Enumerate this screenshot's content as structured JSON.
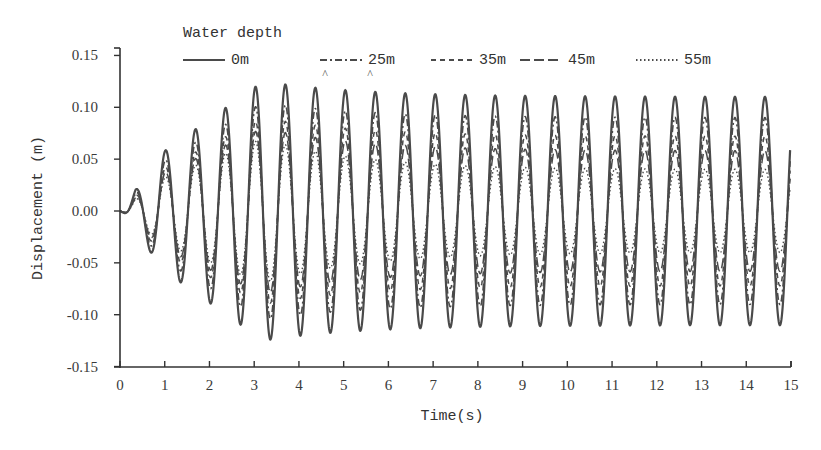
{
  "chart_data": {
    "type": "line",
    "title": "",
    "xlabel": "Time(s)",
    "ylabel": "Displacement (m)",
    "xlim": [
      0,
      15
    ],
    "ylim": [
      -0.15,
      0.15
    ],
    "x_ticks": [
      "0",
      "1",
      "2",
      "3",
      "4",
      "5",
      "6",
      "7",
      "8",
      "9",
      "10",
      "11",
      "12",
      "13",
      "14",
      "15"
    ],
    "y_ticks": [
      "0.15",
      "0.10",
      "0.05",
      "0.00",
      "-0.05",
      "-0.10",
      "-0.15"
    ],
    "grid": false,
    "legend": {
      "title": "Water depth",
      "position": "top",
      "entries": [
        "0m",
        "25m",
        "35m",
        "45m",
        "55m"
      ]
    },
    "period_s": 0.67,
    "series": [
      {
        "name": "0m",
        "style": "solid",
        "steady_amplitude": 0.11,
        "max_peak": 0.125,
        "max_trough": -0.125
      },
      {
        "name": "25m",
        "style": "dash-dot",
        "steady_amplitude": 0.09,
        "max_peak": 0.105,
        "max_trough": -0.11
      },
      {
        "name": "35m",
        "style": "dashed",
        "steady_amplitude": 0.072,
        "max_peak": 0.09,
        "max_trough": -0.1
      },
      {
        "name": "45m",
        "style": "long-dashed",
        "steady_amplitude": 0.058,
        "max_peak": 0.08,
        "max_trough": -0.09
      },
      {
        "name": "55m",
        "style": "dotted",
        "steady_amplitude": 0.04,
        "max_peak": 0.07,
        "max_trough": -0.08
      }
    ],
    "sample_points_0m": {
      "t": [
        0.35,
        0.75,
        1.05,
        1.43,
        1.75,
        2.1,
        2.4,
        2.75,
        3.1,
        3.45,
        3.75,
        4.1,
        4.45,
        4.8,
        5.1,
        5.5,
        5.8,
        15.0
      ],
      "y": [
        0.028,
        -0.05,
        0.07,
        -0.087,
        0.1,
        -0.108,
        0.118,
        -0.12,
        0.125,
        -0.125,
        0.126,
        -0.124,
        0.125,
        -0.12,
        0.123,
        -0.118,
        0.12,
        0.07
      ]
    },
    "annotations": [
      "^ marks above peaks near t=4.5 s and t=5.6 s"
    ]
  },
  "colors": {
    "line": "#4a4a4a",
    "axis": "#333333",
    "background": "#ffffff"
  }
}
